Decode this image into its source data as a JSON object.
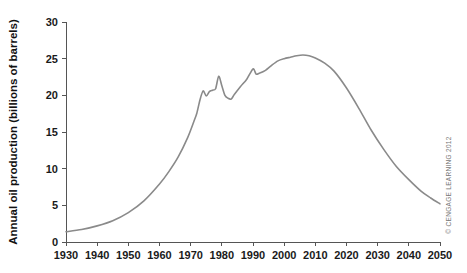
{
  "chart_data": {
    "type": "line",
    "title": "",
    "subtitle": "",
    "xlabel": "",
    "ylabel": "Annual oil production (billions of barrels)",
    "xlim": [
      1930,
      2050
    ],
    "ylim": [
      0,
      30
    ],
    "grid": false,
    "legend": null,
    "x_ticks": [
      1930,
      1940,
      1950,
      1960,
      1970,
      1980,
      1990,
      2000,
      2010,
      2020,
      2030,
      2040,
      2050
    ],
    "y_ticks": [
      0,
      5,
      10,
      15,
      20,
      25,
      30
    ],
    "line_color": "#8a8a8a",
    "series": [
      {
        "name": "Annual oil production",
        "x": [
          1930,
          1935,
          1940,
          1945,
          1950,
          1955,
          1960,
          1963,
          1966,
          1969,
          1971,
          1972,
          1973,
          1974,
          1975,
          1976,
          1977,
          1978,
          1979,
          1980,
          1981,
          1982,
          1983,
          1984,
          1986,
          1988,
          1990,
          1991,
          1992,
          1994,
          1996,
          1998,
          2000,
          2002,
          2004,
          2006,
          2008,
          2010,
          2013,
          2016,
          2020,
          2024,
          2028,
          2032,
          2036,
          2040,
          2044,
          2047,
          2050
        ],
        "y": [
          1.4,
          1.7,
          2.2,
          2.9,
          4.0,
          5.6,
          7.9,
          9.6,
          11.6,
          14.2,
          16.4,
          17.6,
          19.4,
          20.6,
          19.9,
          20.5,
          20.7,
          20.9,
          22.6,
          21.3,
          20.0,
          19.6,
          19.5,
          20.1,
          21.2,
          22.2,
          23.6,
          22.9,
          23.0,
          23.4,
          24.1,
          24.7,
          25.0,
          25.2,
          25.4,
          25.5,
          25.4,
          25.1,
          24.4,
          23.3,
          21.0,
          18.2,
          15.2,
          12.6,
          10.3,
          8.5,
          6.9,
          6.0,
          5.2
        ]
      }
    ]
  },
  "credit": {
    "text": "© CENGAGE LEARNING 2012"
  }
}
